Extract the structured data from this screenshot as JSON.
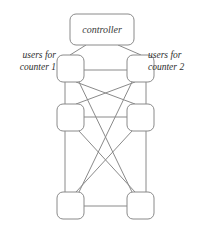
{
  "figure": {
    "type": "node-link-diagram",
    "background_color": "#ffffff",
    "stroke_color": "#8a8a8a",
    "text_color": "#2e2e2e"
  },
  "controller": {
    "label": "controller"
  },
  "labels": {
    "left": {
      "line1": "users for",
      "line2": "counter 1"
    },
    "right": {
      "line1": "users for",
      "line2": "counter 2"
    }
  },
  "nodes": [
    {
      "id": "controller",
      "label": "controller",
      "x": 70,
      "y": 14,
      "w": 64,
      "h": 31,
      "r": 6
    },
    {
      "id": "left-1",
      "label": "",
      "x": 57,
      "y": 55,
      "w": 27,
      "h": 27,
      "r": 6
    },
    {
      "id": "right-1",
      "label": "",
      "x": 127,
      "y": 55,
      "w": 27,
      "h": 27,
      "r": 6
    },
    {
      "id": "left-2",
      "label": "",
      "x": 57,
      "y": 104,
      "w": 27,
      "h": 27,
      "r": 6
    },
    {
      "id": "right-2",
      "label": "",
      "x": 127,
      "y": 104,
      "w": 27,
      "h": 27,
      "r": 6
    },
    {
      "id": "left-3",
      "label": "",
      "x": 57,
      "y": 192,
      "w": 27,
      "h": 27,
      "r": 6
    },
    {
      "id": "right-3",
      "label": "",
      "x": 127,
      "y": 192,
      "w": 27,
      "h": 27,
      "r": 6
    }
  ],
  "edges": [
    {
      "from": "controller",
      "to": "left-1",
      "x1": 86,
      "y1": 45,
      "x2": 70,
      "y2": 55
    },
    {
      "from": "controller",
      "to": "right-1",
      "x1": 118,
      "y1": 45,
      "x2": 141,
      "y2": 55
    },
    {
      "from": "left-1",
      "to": "right-1",
      "x1": 84,
      "y1": 70,
      "x2": 127,
      "y2": 70
    },
    {
      "from": "left-2",
      "to": "right-2",
      "x1": 84,
      "y1": 117,
      "x2": 127,
      "y2": 117
    },
    {
      "from": "left-3",
      "to": "right-3",
      "x1": 84,
      "y1": 206,
      "x2": 127,
      "y2": 206
    },
    {
      "from": "left-1",
      "to": "left-2",
      "x1": 65,
      "y1": 82,
      "x2": 65,
      "y2": 104
    },
    {
      "from": "right-1",
      "to": "right-2",
      "x1": 146,
      "y1": 82,
      "x2": 146,
      "y2": 104
    },
    {
      "from": "left-2",
      "to": "left-3",
      "x1": 65,
      "y1": 131,
      "x2": 65,
      "y2": 192
    },
    {
      "from": "right-2",
      "to": "right-3",
      "x1": 146,
      "y1": 131,
      "x2": 146,
      "y2": 192
    },
    {
      "from": "left-1",
      "to": "right-2",
      "x1": 76,
      "y1": 82,
      "x2": 135,
      "y2": 104
    },
    {
      "from": "right-1",
      "to": "left-2",
      "x1": 135,
      "y1": 82,
      "x2": 76,
      "y2": 104
    },
    {
      "from": "left-1",
      "to": "right-3",
      "x1": 79,
      "y1": 82,
      "x2": 132,
      "y2": 192
    },
    {
      "from": "right-1",
      "to": "left-3",
      "x1": 132,
      "y1": 82,
      "x2": 79,
      "y2": 192
    },
    {
      "from": "left-2",
      "to": "right-3",
      "x1": 79,
      "y1": 131,
      "x2": 135,
      "y2": 192
    },
    {
      "from": "right-2",
      "to": "left-3",
      "x1": 132,
      "y1": 131,
      "x2": 76,
      "y2": 192
    }
  ]
}
